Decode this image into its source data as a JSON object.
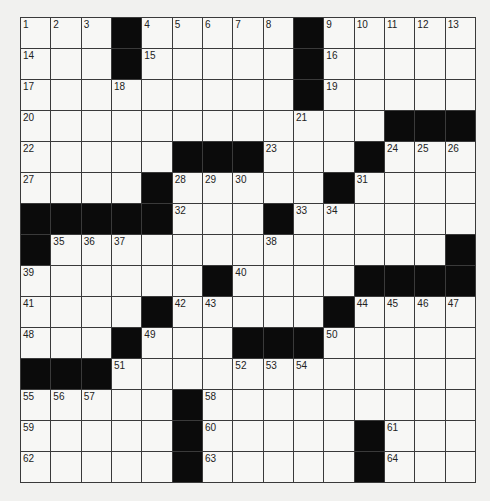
{
  "puzzle": {
    "rows": 15,
    "cols": 15,
    "grid": [
      "...#.....#.....",
      "...#.....#.....",
      ".........#.....",
      "............###",
      ".....###...#...",
      "....#.....#....",
      "#####...#......",
      "#.............#",
      "......#....####",
      "....#.....#....",
      "...#...###.....",
      "###............",
      ".....#.........",
      ".....#.....#...",
      ".....#.....#..."
    ],
    "numbers": [
      {
        "r": 0,
        "c": 0,
        "n": 1
      },
      {
        "r": 0,
        "c": 1,
        "n": 2
      },
      {
        "r": 0,
        "c": 2,
        "n": 3
      },
      {
        "r": 0,
        "c": 4,
        "n": 4
      },
      {
        "r": 0,
        "c": 5,
        "n": 5
      },
      {
        "r": 0,
        "c": 6,
        "n": 6
      },
      {
        "r": 0,
        "c": 7,
        "n": 7
      },
      {
        "r": 0,
        "c": 8,
        "n": 8
      },
      {
        "r": 0,
        "c": 10,
        "n": 9
      },
      {
        "r": 0,
        "c": 11,
        "n": 10
      },
      {
        "r": 0,
        "c": 12,
        "n": 11
      },
      {
        "r": 0,
        "c": 13,
        "n": 12
      },
      {
        "r": 0,
        "c": 14,
        "n": 13
      },
      {
        "r": 1,
        "c": 0,
        "n": 14
      },
      {
        "r": 1,
        "c": 4,
        "n": 15
      },
      {
        "r": 1,
        "c": 10,
        "n": 16
      },
      {
        "r": 2,
        "c": 0,
        "n": 17
      },
      {
        "r": 2,
        "c": 3,
        "n": 18
      },
      {
        "r": 2,
        "c": 10,
        "n": 19
      },
      {
        "r": 3,
        "c": 0,
        "n": 20
      },
      {
        "r": 3,
        "c": 9,
        "n": 21
      },
      {
        "r": 4,
        "c": 0,
        "n": 22
      },
      {
        "r": 4,
        "c": 8,
        "n": 23
      },
      {
        "r": 4,
        "c": 12,
        "n": 24
      },
      {
        "r": 4,
        "c": 13,
        "n": 25
      },
      {
        "r": 4,
        "c": 14,
        "n": 26
      },
      {
        "r": 5,
        "c": 0,
        "n": 27
      },
      {
        "r": 5,
        "c": 5,
        "n": 28
      },
      {
        "r": 5,
        "c": 6,
        "n": 29
      },
      {
        "r": 5,
        "c": 7,
        "n": 30
      },
      {
        "r": 5,
        "c": 11,
        "n": 31
      },
      {
        "r": 6,
        "c": 5,
        "n": 32
      },
      {
        "r": 6,
        "c": 9,
        "n": 33
      },
      {
        "r": 6,
        "c": 10,
        "n": 34
      },
      {
        "r": 7,
        "c": 1,
        "n": 35
      },
      {
        "r": 7,
        "c": 2,
        "n": 36
      },
      {
        "r": 7,
        "c": 3,
        "n": 37
      },
      {
        "r": 7,
        "c": 8,
        "n": 38
      },
      {
        "r": 8,
        "c": 0,
        "n": 39
      },
      {
        "r": 8,
        "c": 7,
        "n": 40
      },
      {
        "r": 9,
        "c": 0,
        "n": 41
      },
      {
        "r": 9,
        "c": 5,
        "n": 42
      },
      {
        "r": 9,
        "c": 6,
        "n": 43
      },
      {
        "r": 9,
        "c": 11,
        "n": 44
      },
      {
        "r": 9,
        "c": 12,
        "n": 45
      },
      {
        "r": 9,
        "c": 13,
        "n": 46
      },
      {
        "r": 9,
        "c": 14,
        "n": 47
      },
      {
        "r": 10,
        "c": 0,
        "n": 48
      },
      {
        "r": 10,
        "c": 4,
        "n": 49
      },
      {
        "r": 10,
        "c": 10,
        "n": 50
      },
      {
        "r": 11,
        "c": 3,
        "n": 51
      },
      {
        "r": 11,
        "c": 7,
        "n": 52
      },
      {
        "r": 11,
        "c": 8,
        "n": 53
      },
      {
        "r": 11,
        "c": 9,
        "n": 54
      },
      {
        "r": 12,
        "c": 0,
        "n": 55
      },
      {
        "r": 12,
        "c": 1,
        "n": 56
      },
      {
        "r": 12,
        "c": 2,
        "n": 57
      },
      {
        "r": 12,
        "c": 6,
        "n": 58
      },
      {
        "r": 13,
        "c": 0,
        "n": 59
      },
      {
        "r": 13,
        "c": 6,
        "n": 60
      },
      {
        "r": 13,
        "c": 12,
        "n": 61
      },
      {
        "r": 14,
        "c": 0,
        "n": 62
      },
      {
        "r": 14,
        "c": 6,
        "n": 63
      },
      {
        "r": 14,
        "c": 12,
        "n": 64
      }
    ]
  }
}
